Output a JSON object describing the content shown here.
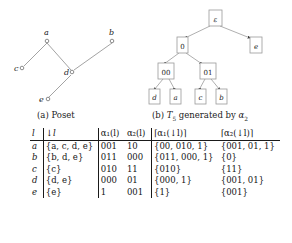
{
  "figures": {
    "poset": {
      "caption": "(a) Poset",
      "nodes": [
        {
          "id": "a",
          "label": "a",
          "x": 47,
          "y": 40
        },
        {
          "id": "b",
          "label": "b",
          "x": 112,
          "y": 40
        },
        {
          "id": "c",
          "label": "c",
          "x": 22,
          "y": 68
        },
        {
          "id": "d",
          "label": "d",
          "x": 72,
          "y": 73
        },
        {
          "id": "e",
          "label": "e",
          "x": 45,
          "y": 99
        }
      ],
      "edges": [
        {
          "from": "c",
          "to": "a"
        },
        {
          "from": "d",
          "to": "a"
        },
        {
          "from": "d",
          "to": "b"
        },
        {
          "from": "e",
          "to": "d"
        }
      ]
    },
    "tree": {
      "caption_prefix": "(b)",
      "caption_symbol": "T",
      "caption_sub": "5",
      "caption_mid": "generated by",
      "caption_alpha": "α",
      "caption_alpha_sub": "2",
      "nodes": [
        {
          "id": "root",
          "label": "ε",
          "x": 63,
          "y": 10,
          "w": 13,
          "h": 16,
          "italic": true
        },
        {
          "id": "n0",
          "label": "0",
          "x": 31,
          "y": 37,
          "w": 11,
          "h": 16,
          "italic": false
        },
        {
          "id": "ne",
          "label": "e",
          "x": 104,
          "y": 37,
          "w": 12,
          "h": 16,
          "italic": true
        },
        {
          "id": "n00",
          "label": "00",
          "x": 12,
          "y": 63,
          "w": 16,
          "h": 16,
          "italic": false
        },
        {
          "id": "n01",
          "label": "01",
          "x": 54,
          "y": 63,
          "w": 16,
          "h": 16,
          "italic": false
        },
        {
          "id": "ld",
          "label": "d",
          "x": 3,
          "y": 89,
          "w": 11,
          "h": 15,
          "italic": true
        },
        {
          "id": "la",
          "label": "a",
          "x": 24,
          "y": 89,
          "w": 11,
          "h": 15,
          "italic": true
        },
        {
          "id": "lc",
          "label": "c",
          "x": 49,
          "y": 89,
          "w": 11,
          "h": 15,
          "italic": true
        },
        {
          "id": "lb",
          "label": "b",
          "x": 70,
          "y": 89,
          "w": 11,
          "h": 15,
          "italic": true
        }
      ],
      "edges": [
        {
          "from": "root",
          "to": "n0"
        },
        {
          "from": "root",
          "to": "ne"
        },
        {
          "from": "n0",
          "to": "n00"
        },
        {
          "from": "n0",
          "to": "n01"
        },
        {
          "from": "n00",
          "to": "ld"
        },
        {
          "from": "n00",
          "to": "la"
        },
        {
          "from": "n01",
          "to": "lc"
        },
        {
          "from": "n01",
          "to": "lb"
        }
      ]
    }
  },
  "table": {
    "headers": [
      "l",
      "↓l",
      "α₁(l)",
      "α₂(l)",
      "⌈α₁(↓l)⌉",
      "⌈α₂(↓l)⌉"
    ],
    "rows": [
      {
        "l": "a",
        "down": "{a, c, d, e}",
        "alpha1": "001",
        "alpha2": "10",
        "ceil1": "{00, 010, 1}",
        "ceil2": "{001, 01, 1}"
      },
      {
        "l": "b",
        "down": "{b, d, e}",
        "alpha1": "011",
        "alpha2": "000",
        "ceil1": "{011, 000, 1}",
        "ceil2": "{0}"
      },
      {
        "l": "c",
        "down": "{c}",
        "alpha1": "010",
        "alpha2": "11",
        "ceil1": "{010}",
        "ceil2": "{11}"
      },
      {
        "l": "d",
        "down": "{d, e}",
        "alpha1": "000",
        "alpha2": "01",
        "ceil1": "{000, 1}",
        "ceil2": "{001, 01}"
      },
      {
        "l": "e",
        "down": "{e}",
        "alpha1": "1",
        "alpha2": "001",
        "ceil1": "{1}",
        "ceil2": "{001}"
      }
    ]
  },
  "colors": {
    "line": "#8c8c8c",
    "text": "#1a1a1a",
    "box_border": "#9a9a9a",
    "rule": "#1a1a1a"
  }
}
